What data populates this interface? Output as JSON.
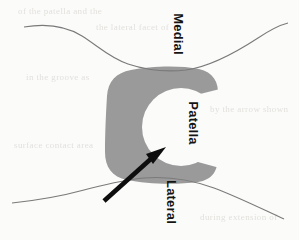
{
  "figure": {
    "name": "patella-cross-section-diagram",
    "kind": "anatomical-line-drawing",
    "width": 299,
    "height": 240,
    "caption_text": "",
    "background_color": "#fbfbfa",
    "cartilage_color": "#9a9a9a",
    "outline_color": "#6f6f6f",
    "arrow_color": "#0d0d0d",
    "label_color": "#141414"
  },
  "labels": {
    "medial": "Medial",
    "patella": "Patella",
    "lateral": "Lateral"
  },
  "annotations": {
    "arrow": {
      "name": "pointer-arrow",
      "points_to": "Patella",
      "direction": "up-right",
      "tail_x": 104,
      "tail_y": 201,
      "tip_x": 163,
      "tip_y": 149
    }
  },
  "regions": {
    "cartilage": {
      "name": "patellar-groove-cartilage",
      "shape": "C-open-right",
      "fill": "#9a9a9a",
      "bounds": {
        "x": 104,
        "y": 67,
        "width": 115,
        "height": 116
      }
    },
    "patella_void": {
      "name": "patella-white-region",
      "shape": "circle-open-right",
      "fill": "#ffffff",
      "center_x": 181,
      "center_y": 127,
      "radius": 39
    }
  },
  "curves": {
    "top_contour": {
      "name": "superior-soft-tissue-contour",
      "description": "descends from upper-left, flattens at center, rises to the right edge"
    },
    "bottom_contour": {
      "name": "inferior-soft-tissue-contour",
      "description": "rises from lower-left to a crest below the cartilage, then descends to the right edge"
    }
  },
  "ghost_text": {
    "name": "scan-bleed-through",
    "lines": [
      "of the patella and the",
      "the lateral facet of",
      "in the groove as",
      "by the arrow shown",
      "surface contact area",
      "during extension of"
    ]
  }
}
